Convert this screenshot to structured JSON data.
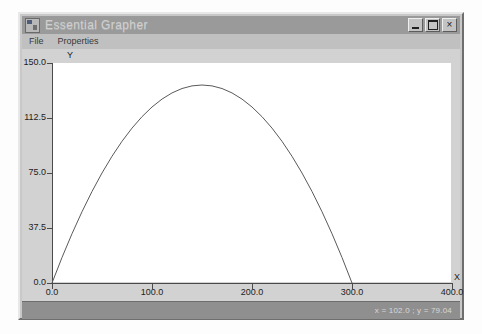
{
  "window": {
    "title": "Essential Grapher",
    "icon": "app-graph-icon",
    "controls": [
      {
        "name": "minimize",
        "glyph": ""
      },
      {
        "name": "maximize",
        "glyph": ""
      },
      {
        "name": "close",
        "glyph": "×"
      }
    ]
  },
  "menubar": {
    "items": [
      {
        "label": "File"
      },
      {
        "label": "Properties"
      }
    ]
  },
  "statusbar": {
    "coordinates": "x = 102.0 ; y = 79.04"
  },
  "chart_data": {
    "type": "line",
    "title": "",
    "xlabel": "X",
    "ylabel": "Y",
    "xlim": [
      0,
      400
    ],
    "ylim": [
      0,
      150
    ],
    "xticks": [
      0,
      100,
      200,
      300,
      400
    ],
    "xticklabels": [
      "0.0",
      "100.0",
      "200.0",
      "300.0",
      "400.0"
    ],
    "yticks": [
      0,
      37.5,
      75,
      112.5,
      150
    ],
    "yticklabels": [
      "0.0",
      "37.5",
      "75.0",
      "112.5",
      "150.0"
    ],
    "grid": false,
    "legend": false,
    "series": [
      {
        "name": "parabola",
        "color": "#5a5a5a",
        "expression": "y = 1.8x - 0.006x^2",
        "x": [
          0,
          10,
          20,
          30,
          40,
          50,
          60,
          70,
          80,
          90,
          100,
          110,
          120,
          130,
          140,
          150,
          160,
          170,
          180,
          190,
          200,
          210,
          220,
          230,
          240,
          250,
          260,
          270,
          280,
          290,
          300,
          310
        ],
        "y": [
          0.0,
          17.4,
          33.6,
          48.6,
          62.4,
          75.0,
          86.4,
          96.6,
          105.6,
          113.4,
          120.0,
          125.4,
          129.6,
          132.6,
          134.4,
          135.0,
          134.4,
          132.6,
          129.6,
          125.4,
          120.0,
          113.4,
          105.6,
          96.6,
          86.4,
          75.0,
          62.4,
          48.6,
          33.6,
          17.4,
          0.0,
          -18.6
        ]
      }
    ]
  }
}
